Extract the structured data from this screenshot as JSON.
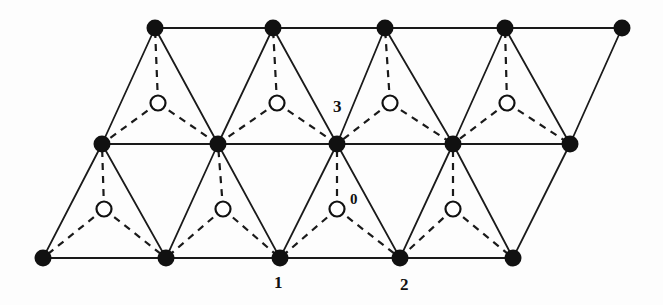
{
  "figure": {
    "background_color": "#fdfdfd",
    "solid_line_color": "#1a1a1a",
    "dashed_line_color": "#1a1a1a",
    "filled_node_color": "#111111",
    "open_node_stroke_color": "#111111",
    "open_node_fill_color": "#ffffff",
    "solid_line_width": 1.8,
    "dashed_line_width": 2.2,
    "dash_pattern": "7,6",
    "filled_node_radius": 8.5,
    "open_node_radius": 7.5
  },
  "chart_data": {
    "type": "scatter",
    "xlabel": "",
    "ylabel": "",
    "xlim": [
      0,
      663
    ],
    "ylim": [
      305,
      0
    ],
    "grid": false,
    "legend": "none",
    "series": [
      {
        "name": "filled-nodes-top-row",
        "marker": "filled-circle",
        "points": [
          {
            "x": 155,
            "y": 28
          },
          {
            "x": 273,
            "y": 28
          },
          {
            "x": 385,
            "y": 28
          },
          {
            "x": 505,
            "y": 28
          },
          {
            "x": 622,
            "y": 28
          }
        ]
      },
      {
        "name": "filled-nodes-middle-row",
        "marker": "filled-circle",
        "points": [
          {
            "x": 102,
            "y": 144
          },
          {
            "x": 218,
            "y": 144
          },
          {
            "x": 337,
            "y": 144
          },
          {
            "x": 453,
            "y": 144
          },
          {
            "x": 570,
            "y": 144
          }
        ]
      },
      {
        "name": "filled-nodes-bottom-row",
        "marker": "filled-circle",
        "points": [
          {
            "x": 43,
            "y": 258
          },
          {
            "x": 166,
            "y": 258
          },
          {
            "x": 280,
            "y": 258
          },
          {
            "x": 400,
            "y": 258
          },
          {
            "x": 513,
            "y": 258
          }
        ]
      },
      {
        "name": "open-nodes-upper-band",
        "marker": "open-circle",
        "points": [
          {
            "x": 158,
            "y": 103
          },
          {
            "x": 277,
            "y": 103
          },
          {
            "x": 390,
            "y": 103
          },
          {
            "x": 507,
            "y": 103
          }
        ]
      },
      {
        "name": "open-nodes-lower-band",
        "marker": "open-circle",
        "points": [
          {
            "x": 104,
            "y": 209
          },
          {
            "x": 223,
            "y": 209
          },
          {
            "x": 337,
            "y": 209
          },
          {
            "x": 453,
            "y": 209
          }
        ]
      }
    ],
    "solid_edges": [
      [
        155,
        28,
        273,
        28
      ],
      [
        273,
        28,
        385,
        28
      ],
      [
        385,
        28,
        505,
        28
      ],
      [
        505,
        28,
        622,
        28
      ],
      [
        102,
        144,
        218,
        144
      ],
      [
        218,
        144,
        337,
        144
      ],
      [
        337,
        144,
        453,
        144
      ],
      [
        453,
        144,
        570,
        144
      ],
      [
        43,
        258,
        166,
        258
      ],
      [
        166,
        258,
        280,
        258
      ],
      [
        280,
        258,
        400,
        258
      ],
      [
        400,
        258,
        513,
        258
      ],
      [
        155,
        28,
        102,
        144
      ],
      [
        155,
        28,
        218,
        144
      ],
      [
        273,
        28,
        218,
        144
      ],
      [
        273,
        28,
        337,
        144
      ],
      [
        385,
        28,
        337,
        144
      ],
      [
        385,
        28,
        453,
        144
      ],
      [
        505,
        28,
        453,
        144
      ],
      [
        505,
        28,
        570,
        144
      ],
      [
        622,
        28,
        570,
        144
      ],
      [
        102,
        144,
        43,
        258
      ],
      [
        102,
        144,
        166,
        258
      ],
      [
        218,
        144,
        166,
        258
      ],
      [
        218,
        144,
        280,
        258
      ],
      [
        337,
        144,
        280,
        258
      ],
      [
        337,
        144,
        400,
        258
      ],
      [
        453,
        144,
        400,
        258
      ],
      [
        453,
        144,
        513,
        258
      ],
      [
        570,
        144,
        513,
        258
      ]
    ],
    "dashed_edges": [
      [
        158,
        103,
        155,
        28
      ],
      [
        158,
        103,
        102,
        144
      ],
      [
        158,
        103,
        218,
        144
      ],
      [
        277,
        103,
        273,
        28
      ],
      [
        277,
        103,
        218,
        144
      ],
      [
        277,
        103,
        337,
        144
      ],
      [
        390,
        103,
        385,
        28
      ],
      [
        390,
        103,
        337,
        144
      ],
      [
        390,
        103,
        453,
        144
      ],
      [
        507,
        103,
        505,
        28
      ],
      [
        507,
        103,
        453,
        144
      ],
      [
        507,
        103,
        570,
        144
      ],
      [
        104,
        209,
        102,
        144
      ],
      [
        104,
        209,
        43,
        258
      ],
      [
        104,
        209,
        166,
        258
      ],
      [
        223,
        209,
        218,
        144
      ],
      [
        223,
        209,
        166,
        258
      ],
      [
        223,
        209,
        280,
        258
      ],
      [
        337,
        209,
        337,
        144
      ],
      [
        337,
        209,
        280,
        258
      ],
      [
        337,
        209,
        400,
        258
      ],
      [
        453,
        209,
        453,
        144
      ],
      [
        453,
        209,
        400,
        258
      ],
      [
        453,
        209,
        513,
        258
      ]
    ],
    "annotations": [
      {
        "text": "3",
        "x": 338,
        "y": 110,
        "anchor": "bottom-left"
      },
      {
        "text": "0",
        "x": 355,
        "y": 202,
        "anchor": "bottom-left"
      },
      {
        "text": "1",
        "x": 279,
        "y": 283,
        "anchor": "top-center"
      },
      {
        "text": "2",
        "x": 405,
        "y": 285,
        "anchor": "top-center"
      }
    ]
  },
  "labels": {
    "site_3": "3",
    "site_0": "0",
    "site_1": "1",
    "site_2": "2"
  }
}
